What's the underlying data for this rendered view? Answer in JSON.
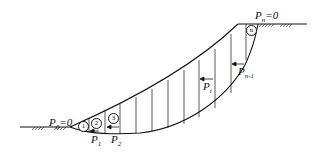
{
  "diagram": {
    "type": "slope-stability-slices",
    "labels": {
      "p0": {
        "base": "P",
        "sub": "0",
        "suffix": "=0"
      },
      "pn": {
        "base": "P",
        "sub": "n",
        "suffix": "=0"
      },
      "p1": {
        "base": "P",
        "sub": "1"
      },
      "p2": {
        "base": "P",
        "sub": "2"
      },
      "pi": {
        "base": "P",
        "sub": "i"
      },
      "pn1": {
        "base": "P",
        "sub": "n-1"
      }
    },
    "slices": {
      "s1": "1",
      "s2": "2",
      "s3": "3",
      "sn": "n"
    },
    "colors": {
      "line": "#111111",
      "background": "#ffffff"
    }
  }
}
